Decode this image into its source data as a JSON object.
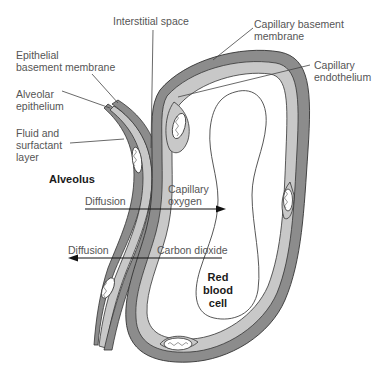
{
  "diagram": {
    "colors": {
      "dark_layer": "#8c8c8c",
      "light_layer": "#c8c8c8",
      "outline": "#333333",
      "rbc_fill": "#ffffff",
      "text": "#555555",
      "bold_text": "#1a1a1a",
      "leader_line": "#444444"
    },
    "labels": {
      "interstitial_space": "Interstitial space",
      "epithelial_basement_membrane": "Epithelial\nbasement membrane",
      "alveolar_epithelium": "Alveolar\nepithelium",
      "fluid_surfactant": "Fluid and\nsurfactant\nlayer",
      "alveolus": "Alveolus",
      "capillary_basement_membrane": "Capillary basement\nmembrane",
      "capillary_endothelium": "Capillary\nendothelium",
      "capillary_oxygen": "Capillary\noxygen",
      "carbon_dioxide": "Carbon dioxide",
      "diffusion_in": "Diffusion",
      "diffusion_out": "Diffusion",
      "red_blood_cell": "Red\nblood\ncell"
    },
    "arrows": [
      {
        "name": "oxygen-diffusion",
        "direction": "right",
        "label": "Diffusion"
      },
      {
        "name": "co2-diffusion",
        "direction": "left",
        "label": "Diffusion"
      }
    ]
  }
}
